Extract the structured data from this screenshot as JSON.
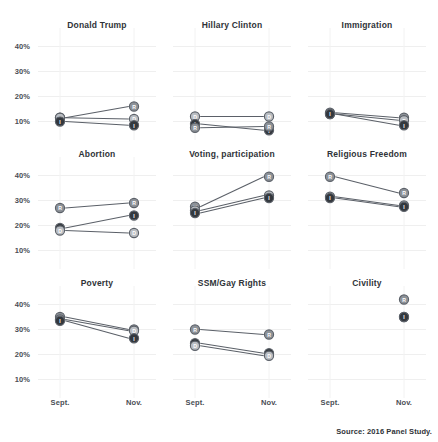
{
  "source_note": "Source: 2016 Panel Study.",
  "axis": {
    "y_ticks": [
      "40%",
      "30%",
      "20%",
      "10%"
    ],
    "y_values": [
      40,
      30,
      20,
      10
    ],
    "x_ticks": [
      "Sept.",
      "Nov."
    ],
    "ylim": [
      5,
      45
    ]
  },
  "legend": {
    "R": "Republican",
    "D": "Democrat",
    "I": "Independent"
  },
  "colors": {
    "republican": "#8d9298",
    "democrat": "#b9bdc2",
    "independent": "#33383e",
    "line": "#5b6068",
    "grid": "#efefef",
    "text": "#3b3f46"
  },
  "chart_data": {
    "type": "line",
    "title": "",
    "xlabel": "",
    "ylabel": "",
    "ylim": [
      5,
      45
    ],
    "grid": true,
    "legend_position": "none",
    "x": [
      "Sept.",
      "Nov."
    ],
    "panels": [
      {
        "title": "Donald Trump",
        "series": [
          {
            "name": "R",
            "values": [
              11.5,
              16.0
            ]
          },
          {
            "name": "D",
            "values": [
              11.5,
              11.0
            ]
          },
          {
            "name": "I",
            "values": [
              10.0,
              8.5
            ]
          }
        ]
      },
      {
        "title": "Hillary Clinton",
        "series": [
          {
            "name": "D",
            "values": [
              12.0,
              12.0
            ]
          },
          {
            "name": "I",
            "values": [
              9.0,
              6.5
            ]
          },
          {
            "name": "R",
            "values": [
              7.5,
              8.0
            ]
          }
        ]
      },
      {
        "title": "Immigration",
        "series": [
          {
            "name": "R",
            "values": [
              13.5,
              11.5
            ]
          },
          {
            "name": "D",
            "values": [
              13.0,
              10.5
            ]
          },
          {
            "name": "I",
            "values": [
              13.0,
              8.5
            ]
          }
        ]
      },
      {
        "title": "Abortion",
        "series": [
          {
            "name": "R",
            "values": [
              27.0,
              29.0
            ]
          },
          {
            "name": "I",
            "values": [
              19.0,
              24.0
            ]
          },
          {
            "name": "D",
            "values": [
              18.0,
              17.0
            ]
          }
        ]
      },
      {
        "title": "Voting, participation",
        "series": [
          {
            "name": "R",
            "values": [
              27.5,
              39.5
            ]
          },
          {
            "name": "D",
            "values": [
              26.0,
              32.0
            ]
          },
          {
            "name": "I",
            "values": [
              25.0,
              31.0
            ]
          }
        ]
      },
      {
        "title": "Religious Freedom",
        "series": [
          {
            "name": "R",
            "values": [
              39.5,
              33.0
            ]
          },
          {
            "name": "D",
            "values": [
              31.5,
              28.0
            ]
          },
          {
            "name": "I",
            "values": [
              31.0,
              27.5
            ]
          }
        ]
      },
      {
        "title": "Poverty",
        "series": [
          {
            "name": "R",
            "values": [
              35.0,
              30.0
            ]
          },
          {
            "name": "D",
            "values": [
              34.0,
              29.5
            ]
          },
          {
            "name": "I",
            "values": [
              33.5,
              26.5
            ]
          }
        ]
      },
      {
        "title": "SSM/Gay Rights",
        "series": [
          {
            "name": "R",
            "values": [
              30.0,
              28.0
            ]
          },
          {
            "name": "I",
            "values": [
              24.5,
              20.5
            ]
          },
          {
            "name": "D",
            "values": [
              23.5,
              19.5
            ]
          }
        ]
      },
      {
        "title": "Civility",
        "series": [
          {
            "name": "R",
            "values": [
              null,
              42.0
            ]
          },
          {
            "name": "D",
            "values": [
              null,
              35.0
            ]
          },
          {
            "name": "I",
            "values": [
              null,
              35.0
            ]
          }
        ]
      }
    ]
  }
}
